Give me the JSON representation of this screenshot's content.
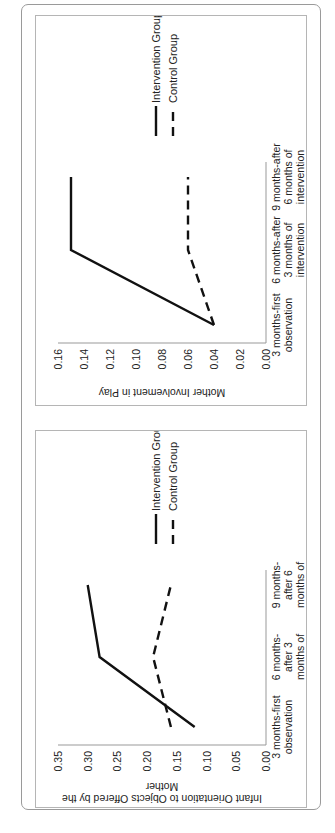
{
  "chart_data": [
    {
      "type": "line",
      "title": "",
      "xlabel": "",
      "ylabel": "Mother Involvement in Play",
      "categories": [
        "3 months-first observation",
        "6 months-after 3 months of intervention",
        "9 months-after 6 months of intervention"
      ],
      "category_lines": [
        [
          "3 months-first",
          "observation"
        ],
        [
          "6 months-after",
          "3 months of",
          "intervention"
        ],
        [
          "9 months-after",
          "6 months of",
          "intervention"
        ]
      ],
      "series": [
        {
          "name": "Intervention Group",
          "style": "solid",
          "values": [
            0.04,
            0.15,
            0.15
          ]
        },
        {
          "name": "Control Group",
          "style": "dashed",
          "values": [
            0.04,
            0.06,
            0.06
          ]
        }
      ],
      "ylim": [
        0,
        0.16
      ],
      "yticks": [
        "0.00",
        "0.02",
        "0.04",
        "0.06",
        "0.08",
        "0.10",
        "0.12",
        "0.14",
        "0.16"
      ],
      "grid": false,
      "legend_position": "right",
      "orientation": "rotated 90deg counterclockwise"
    },
    {
      "type": "line",
      "title": "",
      "xlabel": "",
      "ylabel": "Infant Orientation to Objects Offered by the Mother",
      "ylabel_lines": [
        "Infant Orientation to Objects Offered by the",
        "Mother"
      ],
      "categories": [
        "3 months-first observation",
        "6 months-after 3 months of intervention",
        "9 months-after 6 months of intervention"
      ],
      "category_lines": [
        [
          "3 months-first",
          "observation"
        ],
        [
          "6 months-",
          "after 3",
          "months of",
          "intervention"
        ],
        [
          "9 months-",
          "after 6",
          "months of",
          "intervention"
        ]
      ],
      "series": [
        {
          "name": "Intervention Group",
          "style": "solid",
          "values": [
            0.12,
            0.28,
            0.3
          ]
        },
        {
          "name": "Control Group",
          "style": "dashed",
          "values": [
            0.16,
            0.19,
            0.16
          ]
        }
      ],
      "ylim": [
        0,
        0.35
      ],
      "yticks": [
        "0.00",
        "0.05",
        "0.10",
        "0.15",
        "0.20",
        "0.25",
        "0.30",
        "0.35"
      ],
      "grid": false,
      "legend_position": "right",
      "orientation": "rotated 90deg counterclockwise"
    }
  ]
}
